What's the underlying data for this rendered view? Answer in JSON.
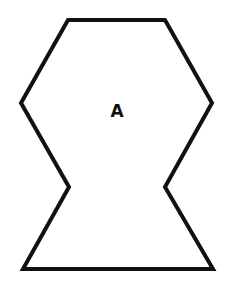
{
  "diagram": {
    "width": 234,
    "height": 287,
    "shape": {
      "type": "polygon",
      "description": "eight-sided figure with indented notches on left and right sides",
      "stroke_color": "#111111",
      "fill_color": "#ffffff",
      "stroke_width": 4,
      "points": [
        [
          68,
          20
        ],
        [
          165,
          20
        ],
        [
          212,
          103
        ],
        [
          165,
          187
        ],
        [
          213,
          269
        ],
        [
          23,
          269
        ],
        [
          69,
          187
        ],
        [
          21,
          103
        ]
      ],
      "points_attr": "68,20 165,20 212,103 165,187 213,269 23,269 69,187 21,103"
    },
    "label": {
      "text": "A",
      "x": 117,
      "y": 117
    }
  }
}
